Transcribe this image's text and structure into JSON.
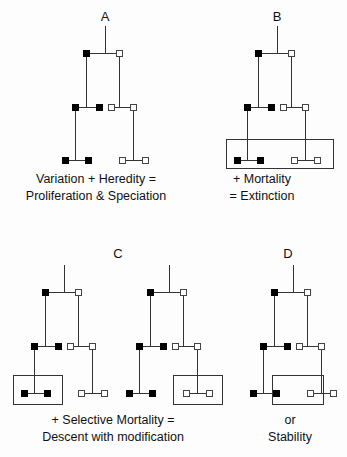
{
  "figure": {
    "width": 347,
    "height": 457,
    "background_color": "#fdfdfd",
    "line_color": "#333333",
    "filled_node_color": "#000000",
    "open_node_color": "#ffffff",
    "text_color": "#111111"
  },
  "panels": [
    {
      "id": "panel-a",
      "letter": "A",
      "letter_pos": {
        "x": 105,
        "y": 21
      },
      "caption": [
        "Variation + Heredity =",
        "Proliferation & Speciation"
      ],
      "caption_pos": {
        "x": 96,
        "y": 183
      },
      "stem": {
        "x": 105,
        "y1": 26,
        "y2": 53
      },
      "branches": [
        {
          "x1": 86,
          "y1": 53,
          "x2": 119,
          "y2": 53
        },
        {
          "x1": 86,
          "y1": 53,
          "x2": 86,
          "y2": 107
        },
        {
          "x1": 119,
          "y1": 53,
          "x2": 119,
          "y2": 107
        },
        {
          "x1": 75,
          "y1": 107,
          "x2": 99,
          "y2": 107
        },
        {
          "x1": 111,
          "y1": 107,
          "x2": 133,
          "y2": 107
        },
        {
          "x1": 75,
          "y1": 107,
          "x2": 75,
          "y2": 160
        },
        {
          "x1": 133,
          "y1": 107,
          "x2": 133,
          "y2": 160
        },
        {
          "x1": 65,
          "y1": 160,
          "x2": 88,
          "y2": 160
        },
        {
          "x1": 122,
          "y1": 160,
          "x2": 145,
          "y2": 160
        }
      ],
      "nodes": [
        {
          "x": 86,
          "y": 53,
          "type": "filled"
        },
        {
          "x": 119,
          "y": 53,
          "type": "open"
        },
        {
          "x": 75,
          "y": 107,
          "type": "filled"
        },
        {
          "x": 99,
          "y": 107,
          "type": "filled"
        },
        {
          "x": 111,
          "y": 107,
          "type": "open"
        },
        {
          "x": 133,
          "y": 107,
          "type": "open"
        },
        {
          "x": 65,
          "y": 160,
          "type": "filled"
        },
        {
          "x": 88,
          "y": 160,
          "type": "filled"
        },
        {
          "x": 122,
          "y": 160,
          "type": "open"
        },
        {
          "x": 145,
          "y": 160,
          "type": "open"
        }
      ],
      "boxes": []
    },
    {
      "id": "panel-b",
      "letter": "B",
      "letter_pos": {
        "x": 277,
        "y": 21
      },
      "caption": [
        "+ Mortality",
        "= Extinction"
      ],
      "caption_pos": {
        "x": 262,
        "y": 183
      },
      "stem": {
        "x": 277,
        "y1": 26,
        "y2": 53
      },
      "branches": [
        {
          "x1": 258,
          "y1": 53,
          "x2": 291,
          "y2": 53
        },
        {
          "x1": 258,
          "y1": 53,
          "x2": 258,
          "y2": 107
        },
        {
          "x1": 291,
          "y1": 53,
          "x2": 291,
          "y2": 107
        },
        {
          "x1": 247,
          "y1": 107,
          "x2": 271,
          "y2": 107
        },
        {
          "x1": 283,
          "y1": 107,
          "x2": 305,
          "y2": 107
        },
        {
          "x1": 247,
          "y1": 107,
          "x2": 247,
          "y2": 160
        },
        {
          "x1": 305,
          "y1": 107,
          "x2": 305,
          "y2": 160
        },
        {
          "x1": 237,
          "y1": 160,
          "x2": 260,
          "y2": 160
        },
        {
          "x1": 294,
          "y1": 160,
          "x2": 317,
          "y2": 160
        }
      ],
      "nodes": [
        {
          "x": 258,
          "y": 53,
          "type": "filled"
        },
        {
          "x": 291,
          "y": 53,
          "type": "open"
        },
        {
          "x": 247,
          "y": 107,
          "type": "filled"
        },
        {
          "x": 271,
          "y": 107,
          "type": "filled"
        },
        {
          "x": 283,
          "y": 107,
          "type": "open"
        },
        {
          "x": 305,
          "y": 107,
          "type": "open"
        },
        {
          "x": 237,
          "y": 160,
          "type": "filled"
        },
        {
          "x": 260,
          "y": 160,
          "type": "filled"
        },
        {
          "x": 294,
          "y": 160,
          "type": "open"
        },
        {
          "x": 317,
          "y": 160,
          "type": "open"
        }
      ],
      "boxes": [
        {
          "x": 226,
          "y": 139,
          "width": 107,
          "height": 29,
          "label": "extinction-box-all-tips"
        }
      ]
    },
    {
      "id": "panel-c-left",
      "letter": "",
      "letter_pos": null,
      "caption": [],
      "caption_pos": null,
      "stem": {
        "x": 64,
        "y1": 265,
        "y2": 292
      },
      "branches": [
        {
          "x1": 45,
          "y1": 292,
          "x2": 78,
          "y2": 292
        },
        {
          "x1": 45,
          "y1": 292,
          "x2": 45,
          "y2": 346
        },
        {
          "x1": 78,
          "y1": 292,
          "x2": 78,
          "y2": 346
        },
        {
          "x1": 34,
          "y1": 346,
          "x2": 58,
          "y2": 346
        },
        {
          "x1": 70,
          "y1": 346,
          "x2": 92,
          "y2": 346
        },
        {
          "x1": 34,
          "y1": 346,
          "x2": 34,
          "y2": 393
        },
        {
          "x1": 92,
          "y1": 346,
          "x2": 92,
          "y2": 393
        },
        {
          "x1": 24,
          "y1": 393,
          "x2": 47,
          "y2": 393
        },
        {
          "x1": 81,
          "y1": 393,
          "x2": 104,
          "y2": 393
        }
      ],
      "nodes": [
        {
          "x": 45,
          "y": 292,
          "type": "filled"
        },
        {
          "x": 78,
          "y": 292,
          "type": "open"
        },
        {
          "x": 34,
          "y": 346,
          "type": "filled"
        },
        {
          "x": 58,
          "y": 346,
          "type": "filled"
        },
        {
          "x": 70,
          "y": 346,
          "type": "open"
        },
        {
          "x": 92,
          "y": 346,
          "type": "open"
        },
        {
          "x": 24,
          "y": 393,
          "type": "filled"
        },
        {
          "x": 47,
          "y": 393,
          "type": "filled"
        },
        {
          "x": 81,
          "y": 393,
          "type": "open"
        },
        {
          "x": 104,
          "y": 393,
          "type": "open"
        }
      ],
      "boxes": [
        {
          "x": 13,
          "y": 375,
          "width": 49,
          "height": 29,
          "label": "selective-mortality-box-filled-tips"
        }
      ]
    },
    {
      "id": "panel-c-right",
      "letter": "C",
      "letter_pos": {
        "x": 118,
        "y": 258
      },
      "caption": [
        "+ Selective Mortality =",
        "Descent with modification"
      ],
      "caption_pos": {
        "x": 113,
        "y": 424
      },
      "stem": {
        "x": 169,
        "y1": 265,
        "y2": 292
      },
      "branches": [
        {
          "x1": 150,
          "y1": 292,
          "x2": 183,
          "y2": 292
        },
        {
          "x1": 150,
          "y1": 292,
          "x2": 150,
          "y2": 346
        },
        {
          "x1": 183,
          "y1": 292,
          "x2": 183,
          "y2": 346
        },
        {
          "x1": 139,
          "y1": 346,
          "x2": 163,
          "y2": 346
        },
        {
          "x1": 175,
          "y1": 346,
          "x2": 197,
          "y2": 346
        },
        {
          "x1": 139,
          "y1": 346,
          "x2": 139,
          "y2": 393
        },
        {
          "x1": 197,
          "y1": 346,
          "x2": 197,
          "y2": 393
        },
        {
          "x1": 129,
          "y1": 393,
          "x2": 152,
          "y2": 393
        },
        {
          "x1": 186,
          "y1": 393,
          "x2": 209,
          "y2": 393
        }
      ],
      "nodes": [
        {
          "x": 150,
          "y": 292,
          "type": "filled"
        },
        {
          "x": 183,
          "y": 292,
          "type": "open"
        },
        {
          "x": 139,
          "y": 346,
          "type": "filled"
        },
        {
          "x": 163,
          "y": 346,
          "type": "filled"
        },
        {
          "x": 175,
          "y": 346,
          "type": "open"
        },
        {
          "x": 197,
          "y": 346,
          "type": "open"
        },
        {
          "x": 129,
          "y": 393,
          "type": "filled"
        },
        {
          "x": 152,
          "y": 393,
          "type": "filled"
        },
        {
          "x": 186,
          "y": 393,
          "type": "open"
        },
        {
          "x": 209,
          "y": 393,
          "type": "open"
        }
      ],
      "boxes": [
        {
          "x": 173,
          "y": 375,
          "width": 49,
          "height": 29,
          "label": "selective-mortality-box-open-tips"
        }
      ]
    },
    {
      "id": "panel-d",
      "letter": "D",
      "letter_pos": {
        "x": 288,
        "y": 258
      },
      "caption": [
        "or",
        "Stability"
      ],
      "caption_pos": {
        "x": 290,
        "y": 424
      },
      "stem": {
        "x": 293,
        "y1": 265,
        "y2": 292
      },
      "branches": [
        {
          "x1": 274,
          "y1": 292,
          "x2": 307,
          "y2": 292
        },
        {
          "x1": 274,
          "y1": 292,
          "x2": 274,
          "y2": 346
        },
        {
          "x1": 307,
          "y1": 292,
          "x2": 307,
          "y2": 346
        },
        {
          "x1": 263,
          "y1": 346,
          "x2": 287,
          "y2": 346
        },
        {
          "x1": 299,
          "y1": 346,
          "x2": 321,
          "y2": 346
        },
        {
          "x1": 263,
          "y1": 346,
          "x2": 263,
          "y2": 393
        },
        {
          "x1": 321,
          "y1": 346,
          "x2": 321,
          "y2": 393
        },
        {
          "x1": 253,
          "y1": 393,
          "x2": 276,
          "y2": 393
        },
        {
          "x1": 310,
          "y1": 393,
          "x2": 333,
          "y2": 393
        }
      ],
      "nodes": [
        {
          "x": 274,
          "y": 292,
          "type": "filled"
        },
        {
          "x": 307,
          "y": 292,
          "type": "open"
        },
        {
          "x": 263,
          "y": 346,
          "type": "filled"
        },
        {
          "x": 287,
          "y": 346,
          "type": "filled"
        },
        {
          "x": 299,
          "y": 346,
          "type": "open"
        },
        {
          "x": 321,
          "y": 346,
          "type": "open"
        },
        {
          "x": 253,
          "y": 393,
          "type": "filled"
        },
        {
          "x": 276,
          "y": 393,
          "type": "filled"
        },
        {
          "x": 310,
          "y": 393,
          "type": "open"
        },
        {
          "x": 333,
          "y": 393,
          "type": "open"
        }
      ],
      "boxes": [
        {
          "x": 272,
          "y": 375,
          "width": 51,
          "height": 29,
          "label": "stability-box-inner-tips"
        }
      ]
    }
  ],
  "node_size": 6,
  "legend_note": ""
}
